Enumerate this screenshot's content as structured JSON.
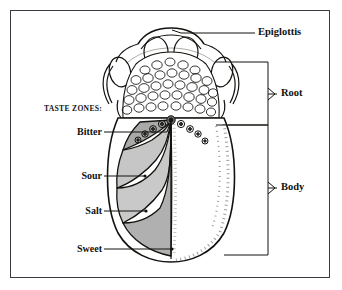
{
  "figure": {
    "kind": "anatomical-illustration",
    "border_color": "#3a3a42",
    "background_color": "#ffffff",
    "ink_color": "#12120f"
  },
  "legend": {
    "taste_zones_header": "TASTE ZONES:"
  },
  "taste_labels": [
    {
      "label": "Bitter",
      "zone_shade": "#a9a9a9"
    },
    {
      "label": "Sour",
      "zone_shade": "#c6c6c6"
    },
    {
      "label": "Salt",
      "zone_shade": "#c9c9c9"
    },
    {
      "label": "Sweet",
      "zone_shade": "#b0b0b0"
    }
  ],
  "part_labels": [
    {
      "label": "Epiglottis",
      "marker": "leader-line"
    },
    {
      "label": "Root",
      "marker": "brace"
    },
    {
      "label": "Body",
      "marker": "brace"
    }
  ]
}
